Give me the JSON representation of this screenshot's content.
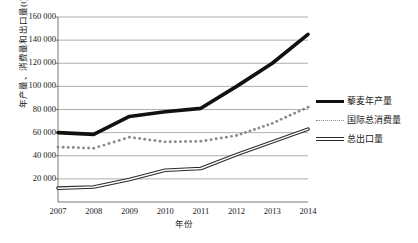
{
  "chart_data": {
    "type": "line",
    "title": "",
    "subtitle": "",
    "xlabel": "年份",
    "ylabel": "年产量、消费量和出口量(t)",
    "categories": [
      "2007",
      "2008",
      "2009",
      "2010",
      "2011",
      "2012",
      "2013",
      "2014"
    ],
    "x": [
      2007,
      2008,
      2009,
      2010,
      2011,
      2012,
      2013,
      2014
    ],
    "xlim": [
      2007,
      2014
    ],
    "ylim": [
      0,
      160000
    ],
    "yticks": [
      20000,
      40000,
      60000,
      80000,
      100000,
      120000,
      140000,
      160000
    ],
    "ytick_labels": [
      "20 000",
      "40 000",
      "60 000",
      "80 000",
      "100 000",
      "120 000",
      "140 000",
      "160 000"
    ],
    "grid": true,
    "grid_axis": "y",
    "legend_position": "right",
    "series": [
      {
        "name": "藜麦年产量",
        "style": "solid-thick",
        "color": "#111111",
        "values": [
          60000,
          58500,
          74000,
          78000,
          81000,
          100000,
          120000,
          145000
        ]
      },
      {
        "name": "国际总消费量",
        "style": "dotted",
        "color": "#8a8a8a",
        "values": [
          47500,
          46500,
          56000,
          52000,
          52500,
          57500,
          68000,
          82000
        ]
      },
      {
        "name": "总出口量",
        "style": "double-line",
        "color": "#2a2a2a",
        "values": [
          12000,
          13000,
          19500,
          27500,
          29000,
          41000,
          52000,
          63000
        ]
      }
    ]
  },
  "legend": {
    "items": [
      {
        "label": "藜麦年产量",
        "swatch": "solid-thick-line-swatch"
      },
      {
        "label": "国际总消费量",
        "swatch": "dotted-line-swatch"
      },
      {
        "label": "总出口量",
        "swatch": "double-line-swatch"
      }
    ]
  },
  "axes": {
    "y_title": "年产量、消费量和出口量(t)",
    "x_title": "年份"
  }
}
